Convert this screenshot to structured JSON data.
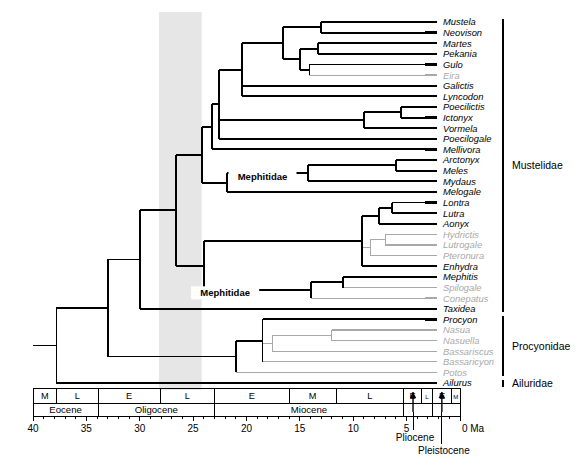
{
  "figure": {
    "type": "phylogenetic-tree",
    "highlight_band": {
      "from_ma": 28.2,
      "to_ma": 24.2,
      "color": "#e6e6e6"
    }
  },
  "taxa": [
    {
      "name": "Mustela",
      "shade": "black",
      "divergence_ma": 7.0
    },
    {
      "name": "Neovison",
      "shade": "black",
      "divergence_ma": 7.0
    },
    {
      "name": "Martes",
      "shade": "black",
      "divergence_ma": 10.5
    },
    {
      "name": "Pekania",
      "shade": "black",
      "divergence_ma": 10.5
    },
    {
      "name": "Gulo",
      "shade": "black",
      "divergence_ma": 13.0
    },
    {
      "name": "Eira",
      "shade": "gray",
      "divergence_ma": 13.5
    },
    {
      "name": "Galictis",
      "shade": "black",
      "divergence_ma": 16.5
    },
    {
      "name": "Lyncodon",
      "shade": "black",
      "divergence_ma": 16.5
    },
    {
      "name": "Poecilictis",
      "shade": "black",
      "divergence_ma": 3.5
    },
    {
      "name": "Ictonyx",
      "shade": "black",
      "divergence_ma": 3.5
    },
    {
      "name": "Vormela",
      "shade": "black",
      "divergence_ma": 8.0
    },
    {
      "name": "Poecilogale",
      "shade": "black",
      "divergence_ma": 16.5
    },
    {
      "name": "Mellivora",
      "shade": "black",
      "divergence_ma": 20.0
    },
    {
      "name": "Arctonyx",
      "shade": "black",
      "divergence_ma": 3.0
    },
    {
      "name": "Meles",
      "shade": "black",
      "divergence_ma": 3.0
    },
    {
      "name": "Mydaus",
      "shade": "black",
      "divergence_ma": 13.0
    },
    {
      "name": "Melogale",
      "shade": "black",
      "divergence_ma": 22.0
    },
    {
      "name": "Lontra",
      "shade": "black",
      "divergence_ma": 5.5
    },
    {
      "name": "Lutra",
      "shade": "black",
      "divergence_ma": 5.5
    },
    {
      "name": "Aonyx",
      "shade": "black",
      "divergence_ma": 7.0
    },
    {
      "name": "Hydrictis",
      "shade": "gray",
      "divergence_ma": 5.0
    },
    {
      "name": "Lutrogale",
      "shade": "gray",
      "divergence_ma": 5.0
    },
    {
      "name": "Pteronura",
      "shade": "gray",
      "divergence_ma": 6.5
    },
    {
      "name": "Enhydra",
      "shade": "black",
      "divergence_ma": 7.5
    },
    {
      "name": "Mephitis",
      "shade": "black",
      "divergence_ma": 9.0
    },
    {
      "name": "Spilogale",
      "shade": "gray",
      "divergence_ma": 9.0
    },
    {
      "name": "Conepatus",
      "shade": "gray",
      "divergence_ma": 12.5
    },
    {
      "name": "Taxidea",
      "shade": "black",
      "divergence_ma": 26.5
    },
    {
      "name": "Procyon",
      "shade": "black",
      "divergence_ma": 13.5
    },
    {
      "name": "Nasua",
      "shade": "gray",
      "divergence_ma": 6.0
    },
    {
      "name": "Nasuella",
      "shade": "gray",
      "divergence_ma": 6.0
    },
    {
      "name": "Bassariscus",
      "shade": "gray",
      "divergence_ma": 12.5
    },
    {
      "name": "Bassaricyon",
      "shade": "gray",
      "divergence_ma": 13.5
    },
    {
      "name": "Potos",
      "shade": "gray",
      "divergence_ma": 18.0
    },
    {
      "name": "Ailurus",
      "shade": "black",
      "divergence_ma": 37.5
    }
  ],
  "clade_labels": [
    {
      "text": "Mephitidae",
      "at_ma": 18.5,
      "row": 14.5
    },
    {
      "text": "Mephitidae",
      "at_ma": 22.0,
      "row": 25.5
    }
  ],
  "family_brackets": [
    {
      "label": "Mustelidae",
      "first_row": 0,
      "last_row": 27
    },
    {
      "label": "Procyonidae",
      "first_row": 28,
      "last_row": 33
    },
    {
      "label": "Ailuridae",
      "first_row": 34,
      "last_row": 34
    }
  ],
  "timescale": {
    "axis_min_ma": 40,
    "axis_max_ma": 0,
    "unit_label": "0 Ma",
    "tick_labels": [
      "40",
      "35",
      "30",
      "25",
      "20",
      "15",
      "10",
      "5"
    ],
    "tick_values": [
      40,
      35,
      30,
      25,
      20,
      15,
      10,
      5
    ],
    "epochs": [
      {
        "name": "Eocene",
        "start_ma": 40.0,
        "end_ma": 33.9
      },
      {
        "name": "Oligocene",
        "start_ma": 33.9,
        "end_ma": 23.0
      },
      {
        "name": "Miocene",
        "start_ma": 23.0,
        "end_ma": 5.3
      },
      {
        "name": "Pliocene",
        "start_ma": 5.3,
        "end_ma": 2.6
      },
      {
        "name": "Pleistocene",
        "start_ma": 2.6,
        "end_ma": 0.0
      }
    ],
    "subdivisions": [
      {
        "label": "M",
        "start_ma": 40.0,
        "end_ma": 37.8
      },
      {
        "label": "L",
        "start_ma": 37.8,
        "end_ma": 33.9
      },
      {
        "label": "E",
        "start_ma": 33.9,
        "end_ma": 28.1
      },
      {
        "label": "L",
        "start_ma": 28.1,
        "end_ma": 23.0
      },
      {
        "label": "E",
        "start_ma": 23.0,
        "end_ma": 16.0
      },
      {
        "label": "M",
        "start_ma": 16.0,
        "end_ma": 11.6
      },
      {
        "label": "L",
        "start_ma": 11.6,
        "end_ma": 5.3
      },
      {
        "label": "E",
        "start_ma": 5.3,
        "end_ma": 3.6
      },
      {
        "label": "L",
        "start_ma": 3.6,
        "end_ma": 2.6
      },
      {
        "label": "E",
        "start_ma": 2.6,
        "end_ma": 0.78
      },
      {
        "label": "M",
        "start_ma": 0.78,
        "end_ma": 0.0
      }
    ],
    "callouts": [
      {
        "text": "Pliocene",
        "at_ma": 4.4
      },
      {
        "text": "Pleistocene",
        "at_ma": 1.7
      }
    ]
  }
}
